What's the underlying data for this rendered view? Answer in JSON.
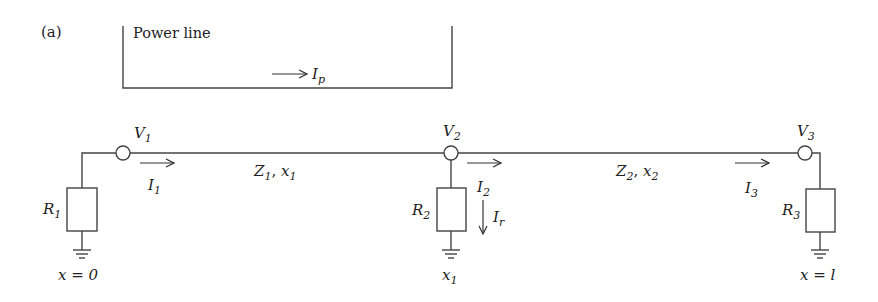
{
  "figure": {
    "panel_label": "(a)",
    "power_line": {
      "label": "Power line",
      "current": {
        "symbol": "I",
        "sub": "p"
      }
    },
    "nodes": [
      {
        "id": "V1",
        "symbol": "V",
        "sub": "1"
      },
      {
        "id": "V2",
        "symbol": "V",
        "sub": "2"
      },
      {
        "id": "V3",
        "symbol": "V",
        "sub": "3"
      }
    ],
    "currents": [
      {
        "id": "I1",
        "symbol": "I",
        "sub": "1"
      },
      {
        "id": "I2",
        "symbol": "I",
        "sub": "2"
      },
      {
        "id": "I3",
        "symbol": "I",
        "sub": "3"
      },
      {
        "id": "Ir",
        "symbol": "I",
        "sub": "r"
      }
    ],
    "segments": [
      {
        "id": "seg1",
        "Z": "Z",
        "Z_sub": "1",
        "x": "x",
        "x_sub": "1"
      },
      {
        "id": "seg2",
        "Z": "Z",
        "Z_sub": "2",
        "x": "x",
        "x_sub": "2"
      }
    ],
    "resistors": [
      {
        "id": "R1",
        "symbol": "R",
        "sub": "1"
      },
      {
        "id": "R2",
        "symbol": "R",
        "sub": "2"
      },
      {
        "id": "R3",
        "symbol": "R",
        "sub": "3"
      }
    ],
    "positions": [
      {
        "id": "pos0",
        "text": "x = 0"
      },
      {
        "id": "pos1",
        "symbol": "x",
        "sub": "1"
      },
      {
        "id": "posl",
        "text": "x = l"
      }
    ],
    "colors": {
      "line": "#444444",
      "text": "#222222",
      "background": "#ffffff"
    }
  }
}
